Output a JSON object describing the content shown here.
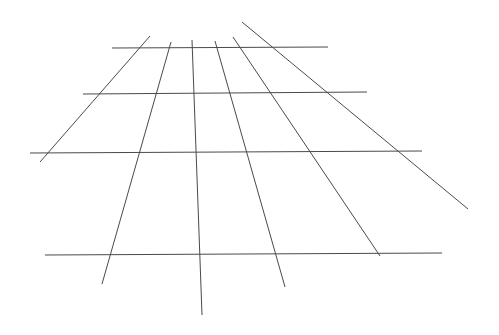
{
  "diagram": {
    "stroke_color": "#4a4a4a",
    "background": "#ffffff",
    "horizontal_lines": [
      {
        "x1": 112,
        "y1": 48,
        "x2": 328,
        "y2": 47
      },
      {
        "x1": 83,
        "y1": 94,
        "x2": 367,
        "y2": 92
      },
      {
        "x1": 30,
        "y1": 153,
        "x2": 422,
        "y2": 151
      },
      {
        "x1": 45,
        "y1": 255,
        "x2": 442,
        "y2": 253
      }
    ],
    "converging_lines": [
      {
        "x1": 150,
        "y1": 36,
        "x2": 40,
        "y2": 162
      },
      {
        "x1": 171,
        "y1": 42,
        "x2": 102,
        "y2": 284
      },
      {
        "x1": 192,
        "y1": 40,
        "x2": 202,
        "y2": 315
      },
      {
        "x1": 215,
        "y1": 41,
        "x2": 285,
        "y2": 287
      },
      {
        "x1": 233,
        "y1": 37,
        "x2": 380,
        "y2": 256
      },
      {
        "x1": 242,
        "y1": 22,
        "x2": 468,
        "y2": 209
      }
    ]
  }
}
